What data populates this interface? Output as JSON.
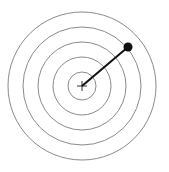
{
  "diagram": {
    "type": "concentric-target-with-vector",
    "center": {
      "x": 82,
      "y": 86
    },
    "ring_radii": [
      74,
      59,
      44,
      29,
      14
    ],
    "ring_color": "#8a8a8a",
    "vector": {
      "from": {
        "x": 82,
        "y": 86
      },
      "to": {
        "x": 128,
        "y": 47
      },
      "color": "#111111"
    },
    "endpoint_dot": {
      "x": 128,
      "y": 47,
      "r": 4.5,
      "color": "#111111"
    },
    "center_marker": "plus"
  }
}
